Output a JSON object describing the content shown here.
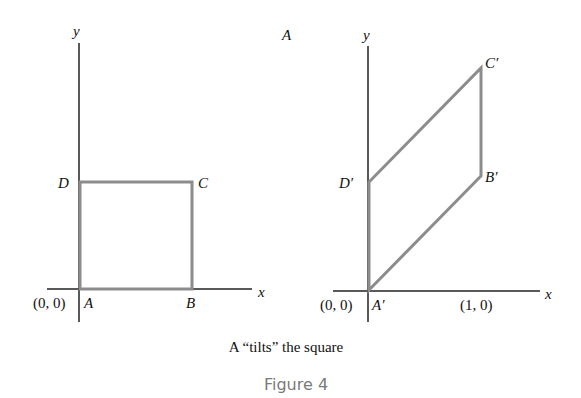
{
  "left_diagram": {
    "axis_y_label": "y",
    "axis_x_label": "x",
    "origin_label": "(0, 0)",
    "vertices": {
      "A": "A",
      "B": "B",
      "C": "C",
      "D": "D"
    }
  },
  "matrix_label": "A",
  "right_diagram": {
    "axis_y_label": "y",
    "axis_x_label": "x",
    "origin_label": "(0, 0)",
    "unit_label": "(1, 0)",
    "vertices": {
      "A": "A′",
      "B": "B′",
      "C": "C′",
      "D": "D′"
    }
  },
  "caption": "A “tilts” the square",
  "figure_label": "Figure 4",
  "colors": {
    "shape": "#8c8c8c",
    "axis": "#222222",
    "figure_label": "#7a7a7a"
  }
}
